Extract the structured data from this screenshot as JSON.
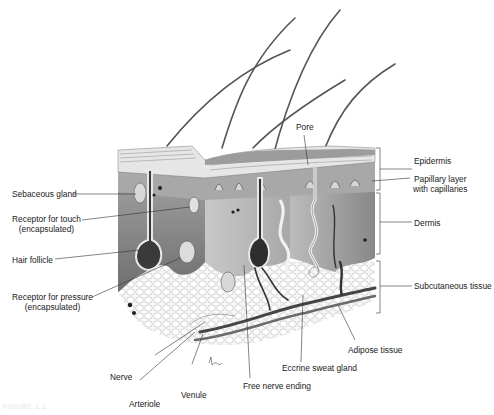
{
  "figure": {
    "caption": "FIGURE 1.1",
    "colors": {
      "ink": "#1a1a1a",
      "dermis": "#8a8a8a",
      "epidermis": "#bdbdbd",
      "adipose": "#f2f2f2",
      "vessel": "#3c3c3c"
    }
  },
  "labels_left": [
    {
      "id": "sebaceous-gland",
      "text": "Sebaceous gland"
    },
    {
      "id": "receptor-touch",
      "text": "Receptor for touch",
      "sub": "(encapsulated)"
    },
    {
      "id": "hair-follicle",
      "text": "Hair follicle"
    },
    {
      "id": "receptor-pressure",
      "text": "Receptor for pressure",
      "sub": "(encapsulated)"
    }
  ],
  "labels_right": [
    {
      "id": "epidermis",
      "text": "Epidermis"
    },
    {
      "id": "papillary-layer",
      "text": "Papillary layer",
      "sub": "with capillaries"
    },
    {
      "id": "dermis",
      "text": "Dermis"
    },
    {
      "id": "subcutaneous",
      "text": "Subcutaneous tissue"
    }
  ],
  "labels_top": [
    {
      "id": "pore",
      "text": "Pore"
    }
  ],
  "labels_bottom": [
    {
      "id": "adipose",
      "text": "Adipose tissue"
    },
    {
      "id": "eccrine",
      "text": "Eccrine sweat gland"
    },
    {
      "id": "free-nerve",
      "text": "Free nerve ending"
    },
    {
      "id": "nerve",
      "text": "Nerve"
    },
    {
      "id": "venule",
      "text": "Venule"
    },
    {
      "id": "arteriole",
      "text": "Arteriole"
    }
  ],
  "layers": [
    {
      "name": "Epidermis",
      "bracket_top": 148,
      "bracket_bottom": 190
    },
    {
      "name": "Dermis",
      "bracket_top": 193,
      "bracket_bottom": 254
    },
    {
      "name": "Subcutaneous tissue",
      "bracket_top": 261,
      "bracket_bottom": 313
    }
  ]
}
